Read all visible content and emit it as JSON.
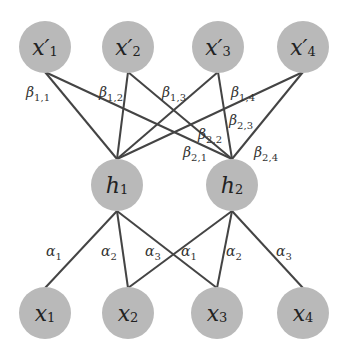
{
  "diagram": {
    "colors": {
      "node_fill": "#b9b9b9",
      "edge": "#444444",
      "text": "#222222",
      "background": "#ffffff"
    },
    "top_nodes": [
      {
        "id": "xp1",
        "base": "x′",
        "sub": "1",
        "cx": 45,
        "cy": 47
      },
      {
        "id": "xp2",
        "base": "x′",
        "sub": "2",
        "cx": 128,
        "cy": 47
      },
      {
        "id": "xp3",
        "base": "x′",
        "sub": "3",
        "cx": 218,
        "cy": 47
      },
      {
        "id": "xp4",
        "base": "x′",
        "sub": "4",
        "cx": 303,
        "cy": 47
      }
    ],
    "hidden_nodes": [
      {
        "id": "h1",
        "base": "h",
        "sub": "1",
        "cx": 117,
        "cy": 185
      },
      {
        "id": "h2",
        "base": "h",
        "sub": "2",
        "cx": 232,
        "cy": 185
      }
    ],
    "bottom_nodes": [
      {
        "id": "x1",
        "base": "x",
        "sub": "1",
        "cx": 45,
        "cy": 313
      },
      {
        "id": "x2",
        "base": "x",
        "sub": "2",
        "cx": 128,
        "cy": 313
      },
      {
        "id": "x3",
        "base": "x",
        "sub": "3",
        "cx": 217,
        "cy": 313
      },
      {
        "id": "x4",
        "base": "x",
        "sub": "4",
        "cx": 303,
        "cy": 313
      }
    ],
    "beta_labels": [
      {
        "base": "β",
        "sub": "1,1",
        "x": 26,
        "y": 84
      },
      {
        "base": "β",
        "sub": "1,2",
        "x": 99,
        "y": 84
      },
      {
        "base": "β",
        "sub": "1,3",
        "x": 162,
        "y": 84
      },
      {
        "base": "β",
        "sub": "1,4",
        "x": 231,
        "y": 84
      },
      {
        "base": "β",
        "sub": "2,2",
        "x": 198,
        "y": 126
      },
      {
        "base": "β",
        "sub": "2,3",
        "x": 229,
        "y": 112
      },
      {
        "base": "β",
        "sub": "2,1",
        "x": 183,
        "y": 144
      },
      {
        "base": "β",
        "sub": "2,4",
        "x": 254,
        "y": 144
      }
    ],
    "alpha_labels": [
      {
        "base": "α",
        "sub": "1",
        "x": 46,
        "y": 243
      },
      {
        "base": "α",
        "sub": "2",
        "x": 101,
        "y": 243
      },
      {
        "base": "α",
        "sub": "3",
        "x": 145,
        "y": 243
      },
      {
        "base": "α",
        "sub": "1",
        "x": 181,
        "y": 243
      },
      {
        "base": "α",
        "sub": "2",
        "x": 226,
        "y": 243
      },
      {
        "base": "α",
        "sub": "3",
        "x": 276,
        "y": 243
      }
    ],
    "edges_top": [
      {
        "from": "xp1",
        "to": "h1"
      },
      {
        "from": "xp1",
        "to": "h2"
      },
      {
        "from": "xp2",
        "to": "h1"
      },
      {
        "from": "xp2",
        "to": "h2"
      },
      {
        "from": "xp3",
        "to": "h1"
      },
      {
        "from": "xp3",
        "to": "h2"
      },
      {
        "from": "xp4",
        "to": "h1"
      },
      {
        "from": "xp4",
        "to": "h2"
      }
    ],
    "edges_bottom": [
      {
        "from": "h1",
        "to": "x1"
      },
      {
        "from": "h1",
        "to": "x2"
      },
      {
        "from": "h1",
        "to": "x3"
      },
      {
        "from": "h2",
        "to": "x2"
      },
      {
        "from": "h2",
        "to": "x3"
      },
      {
        "from": "h2",
        "to": "x4"
      }
    ]
  }
}
